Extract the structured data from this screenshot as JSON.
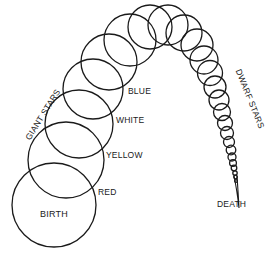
{
  "colors": {
    "stroke": "#1a1a1a",
    "background": "#ffffff"
  },
  "labels": {
    "birth": "BIRTH",
    "red": "RED",
    "yellow": "YELLOW",
    "white": "WHITE",
    "blue": "BLUE",
    "giant_stars": "GIANT STARS",
    "dwarf_stars": "DWARF STARS",
    "death": "DEATH"
  },
  "stages": [
    {
      "name": "birth",
      "cx": 54,
      "cy": 205,
      "r": 42
    },
    {
      "name": "red",
      "cx": 66,
      "cy": 160,
      "r": 38
    },
    {
      "name": "yellow",
      "cx": 79,
      "cy": 124,
      "r": 34
    },
    {
      "name": "white",
      "cx": 93,
      "cy": 89,
      "r": 30
    },
    {
      "name": "blue",
      "cx": 109,
      "cy": 62,
      "r": 28
    },
    {
      "name": "s6",
      "cx": 130,
      "cy": 40,
      "r": 26
    },
    {
      "name": "s7",
      "cx": 150,
      "cy": 27,
      "r": 22
    },
    {
      "name": "s8",
      "cx": 168,
      "cy": 25,
      "r": 20
    },
    {
      "name": "s9",
      "cx": 184,
      "cy": 33,
      "r": 18
    },
    {
      "name": "s10",
      "cx": 197,
      "cy": 45,
      "r": 16
    },
    {
      "name": "s11",
      "cx": 204,
      "cy": 60,
      "r": 14
    },
    {
      "name": "s12",
      "cx": 210,
      "cy": 73,
      "r": 12.5
    },
    {
      "name": "s13",
      "cx": 215,
      "cy": 87,
      "r": 11
    },
    {
      "name": "s14",
      "cx": 219,
      "cy": 100,
      "r": 10
    },
    {
      "name": "s15",
      "cx": 222,
      "cy": 112,
      "r": 8.5
    },
    {
      "name": "s16",
      "cx": 225,
      "cy": 123,
      "r": 7.5
    },
    {
      "name": "s17",
      "cx": 227,
      "cy": 133,
      "r": 6.5
    },
    {
      "name": "s18",
      "cx": 229,
      "cy": 142,
      "r": 5.5
    },
    {
      "name": "s19",
      "cx": 231,
      "cy": 150,
      "r": 4.8
    },
    {
      "name": "s20",
      "cx": 232,
      "cy": 157,
      "r": 4
    },
    {
      "name": "s21",
      "cx": 233,
      "cy": 163,
      "r": 3.4
    },
    {
      "name": "s22",
      "cx": 234,
      "cy": 168,
      "r": 2.8
    },
    {
      "name": "s23",
      "cx": 235,
      "cy": 173,
      "r": 2.2
    },
    {
      "name": "s24",
      "cx": 235.5,
      "cy": 177,
      "r": 1.8
    },
    {
      "name": "s25",
      "cx": 236,
      "cy": 181,
      "r": 1.4
    }
  ]
}
